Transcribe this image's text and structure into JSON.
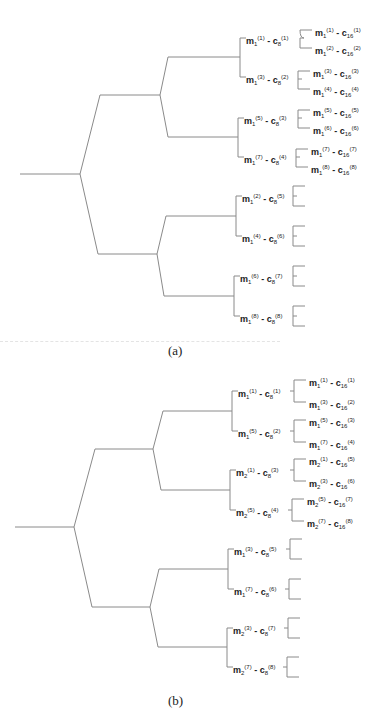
{
  "figure_a": {
    "caption": "(a)",
    "level3": [
      {
        "m": "m",
        "ms": "1",
        "mi": "(1)",
        "c": "c",
        "cs": "8",
        "ci": "(1)"
      },
      {
        "m": "m",
        "ms": "1",
        "mi": "(3)",
        "c": "c",
        "cs": "8",
        "ci": "(2)"
      },
      {
        "m": "m",
        "ms": "1",
        "mi": "(5)",
        "c": "c",
        "cs": "8",
        "ci": "(3)"
      },
      {
        "m": "m",
        "ms": "1",
        "mi": "(7)",
        "c": "c",
        "cs": "8",
        "ci": "(4)"
      },
      {
        "m": "m",
        "ms": "1",
        "mi": "(2)",
        "c": "c",
        "cs": "8",
        "ci": "(5)"
      },
      {
        "m": "m",
        "ms": "1",
        "mi": "(4)",
        "c": "c",
        "cs": "8",
        "ci": "(6)"
      },
      {
        "m": "m",
        "ms": "1",
        "mi": "(6)",
        "c": "c",
        "cs": "8",
        "ci": "(7)"
      },
      {
        "m": "m",
        "ms": "1",
        "mi": "(8)",
        "c": "c",
        "cs": "8",
        "ci": "(8)"
      }
    ],
    "leaves": [
      {
        "m": "m",
        "ms": "1",
        "mi": "(1)",
        "c": "c",
        "cs": "16",
        "ci": "(1)"
      },
      {
        "m": "m",
        "ms": "1",
        "mi": "(2)",
        "c": "c",
        "cs": "16",
        "ci": "(2)"
      },
      {
        "m": "m",
        "ms": "1",
        "mi": "(3)",
        "c": "c",
        "cs": "16",
        "ci": "(3)"
      },
      {
        "m": "m",
        "ms": "1",
        "mi": "(4)",
        "c": "c",
        "cs": "16",
        "ci": "(4)"
      },
      {
        "m": "m",
        "ms": "1",
        "mi": "(5)",
        "c": "c",
        "cs": "16",
        "ci": "(5)"
      },
      {
        "m": "m",
        "ms": "1",
        "mi": "(6)",
        "c": "c",
        "cs": "16",
        "ci": "(6)"
      },
      {
        "m": "m",
        "ms": "1",
        "mi": "(7)",
        "c": "c",
        "cs": "16",
        "ci": "(7)"
      },
      {
        "m": "m",
        "ms": "1",
        "mi": "(8)",
        "c": "c",
        "cs": "16",
        "ci": "(8)"
      }
    ]
  },
  "figure_b": {
    "caption": "(b)",
    "level3": [
      {
        "m": "m",
        "ms": "1",
        "mi": "(1)",
        "c": "c",
        "cs": "8",
        "ci": "(1)"
      },
      {
        "m": "m",
        "ms": "1",
        "mi": "(5)",
        "c": "c",
        "cs": "8",
        "ci": "(2)"
      },
      {
        "m": "m",
        "ms": "2",
        "mi": "(1)",
        "c": "c",
        "cs": "8",
        "ci": "(3)"
      },
      {
        "m": "m",
        "ms": "2",
        "mi": "(5)",
        "c": "c",
        "cs": "8",
        "ci": "(4)"
      },
      {
        "m": "m",
        "ms": "1",
        "mi": "(3)",
        "c": "c",
        "cs": "8",
        "ci": "(5)"
      },
      {
        "m": "m",
        "ms": "1",
        "mi": "(7)",
        "c": "c",
        "cs": "8",
        "ci": "(6)"
      },
      {
        "m": "m",
        "ms": "2",
        "mi": "(3)",
        "c": "c",
        "cs": "8",
        "ci": "(7)"
      },
      {
        "m": "m",
        "ms": "2",
        "mi": "(7)",
        "c": "c",
        "cs": "8",
        "ci": "(8)"
      }
    ],
    "leaves": [
      {
        "m": "m",
        "ms": "1",
        "mi": "(1)",
        "c": "c",
        "cs": "16",
        "ci": "(1)"
      },
      {
        "m": "m",
        "ms": "1",
        "mi": "(3)",
        "c": "c",
        "cs": "16",
        "ci": "(2)"
      },
      {
        "m": "m",
        "ms": "1",
        "mi": "(5)",
        "c": "c",
        "cs": "16",
        "ci": "(3)"
      },
      {
        "m": "m",
        "ms": "1",
        "mi": "(7)",
        "c": "c",
        "cs": "16",
        "ci": "(4)"
      },
      {
        "m": "m",
        "ms": "2",
        "mi": "(1)",
        "c": "c",
        "cs": "16",
        "ci": "(5)"
      },
      {
        "m": "m",
        "ms": "2",
        "mi": "(3)",
        "c": "c",
        "cs": "16",
        "ci": "(6)"
      },
      {
        "m": "m",
        "ms": "2",
        "mi": "(5)",
        "c": "c",
        "cs": "16",
        "ci": "(7)"
      },
      {
        "m": "m",
        "ms": "2",
        "mi": "(7)",
        "c": "c",
        "cs": "16",
        "ci": "(8)"
      }
    ]
  },
  "separator": "-",
  "colors": {
    "line": "#8a8a8a",
    "text": "#222222"
  }
}
